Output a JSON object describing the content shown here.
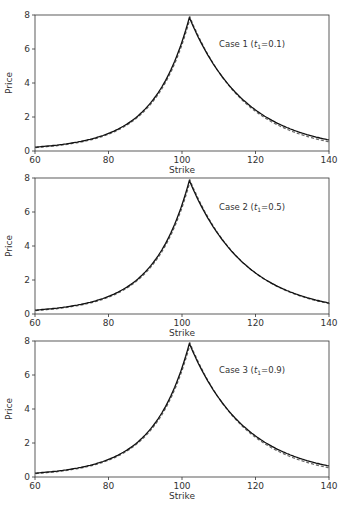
{
  "chart_data": [
    {
      "type": "line",
      "title": "",
      "annotation": "Case 1 (t1=0.1)",
      "annotation_main": "Case 1 (",
      "annotation_var": "t",
      "annotation_sub": "1",
      "annotation_tail": "=0.1)",
      "xlabel": "Strike",
      "ylabel": "Price",
      "xlim": [
        60,
        140
      ],
      "ylim": [
        0,
        8
      ],
      "xticks": [
        "60",
        "80",
        "100",
        "120",
        "140"
      ],
      "yticks": [
        "0",
        "2",
        "4",
        "6",
        "8"
      ],
      "peak": 102,
      "peak_value": 7.85,
      "left_rate": 0.101,
      "right_rate": 0.0655,
      "dash_offset": 0.08
    },
    {
      "type": "line",
      "title": "",
      "annotation": "Case 2 (t1=0.5)",
      "annotation_main": "Case 2 (",
      "annotation_var": "t",
      "annotation_sub": "1",
      "annotation_tail": "=0.5)",
      "xlabel": "Strike",
      "ylabel": "Price",
      "xlim": [
        60,
        140
      ],
      "ylim": [
        0,
        8
      ],
      "xticks": [
        "60",
        "80",
        "100",
        "120",
        "140"
      ],
      "yticks": [
        "0",
        "2",
        "4",
        "6",
        "8"
      ],
      "peak": 102,
      "peak_value": 7.85,
      "left_rate": 0.101,
      "right_rate": 0.0655,
      "dash_offset": 0.03
    },
    {
      "type": "line",
      "title": "",
      "annotation": "Case 3 (t1=0.9)",
      "annotation_main": "Case 3 (",
      "annotation_var": "t",
      "annotation_sub": "1",
      "annotation_tail": "=0.9)",
      "xlabel": "Strike",
      "ylabel": "Price",
      "xlim": [
        60,
        140
      ],
      "ylim": [
        0,
        8
      ],
      "xticks": [
        "60",
        "80",
        "100",
        "120",
        "140"
      ],
      "yticks": [
        "0",
        "2",
        "4",
        "6",
        "8"
      ],
      "peak": 102,
      "peak_value": 7.85,
      "left_rate": 0.101,
      "right_rate": 0.0655,
      "dash_offset": 0.08
    }
  ]
}
